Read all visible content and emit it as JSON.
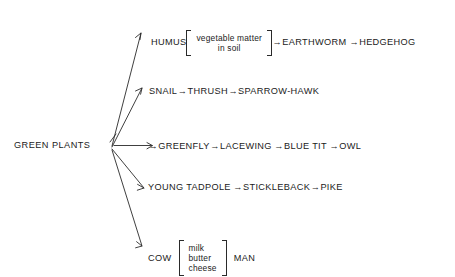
{
  "diagram": {
    "type": "food-web",
    "background_color": "#ffffff",
    "ink_color": "#1b1b1b",
    "source_node": {
      "label": "GREEN PLANTS",
      "x": 14,
      "y": 140
    },
    "arrow_glyph": "→",
    "branches": [
      {
        "id": "humus",
        "row_y": 30,
        "arrow_tip": {
          "x": 141,
          "y": 33
        },
        "items": [
          {
            "kind": "text",
            "label": "HUMUS"
          },
          {
            "kind": "bracket",
            "lines": [
              "vegetable matter",
              "in soil"
            ],
            "align": "center"
          },
          {
            "kind": "arrow",
            "label": "→"
          },
          {
            "kind": "text",
            "label": "EARTHWORM"
          },
          {
            "kind": "arrow",
            "label": "→"
          },
          {
            "kind": "text",
            "label": "HEDGEHOG"
          }
        ]
      },
      {
        "id": "snail",
        "row_y": 86,
        "arrow_tip": {
          "x": 142,
          "y": 88
        },
        "items": [
          {
            "kind": "text",
            "label": "SNAIL"
          },
          {
            "kind": "arrow",
            "label": "→"
          },
          {
            "kind": "text",
            "label": "THRUSH"
          },
          {
            "kind": "arrow",
            "label": "→"
          },
          {
            "kind": "text",
            "label": "SPARROW-HAWK"
          }
        ]
      },
      {
        "id": "greenfly",
        "row_y": 141,
        "arrow_tip": {
          "x": 152,
          "y": 146
        },
        "items": [
          {
            "kind": "arrow",
            "label": "→"
          },
          {
            "kind": "text",
            "label": "GREENFLY"
          },
          {
            "kind": "arrow",
            "label": "→"
          },
          {
            "kind": "text",
            "label": "LACEWING"
          },
          {
            "kind": "arrow",
            "label": "→"
          },
          {
            "kind": "text",
            "label": "BLUE TIT"
          },
          {
            "kind": "arrow",
            "label": "→"
          },
          {
            "kind": "text",
            "label": "OWL"
          }
        ]
      },
      {
        "id": "tadpole",
        "row_y": 182,
        "arrow_tip": {
          "x": 144,
          "y": 188
        },
        "items": [
          {
            "kind": "text",
            "label": "YOUNG TADPOLE"
          },
          {
            "kind": "arrow",
            "label": "→"
          },
          {
            "kind": "text",
            "label": "STICKLEBACK"
          },
          {
            "kind": "arrow",
            "label": "→"
          },
          {
            "kind": "text",
            "label": "PIKE"
          }
        ]
      },
      {
        "id": "cow",
        "row_y": 240,
        "arrow_tip": {
          "x": 142,
          "y": 246
        },
        "items": [
          {
            "kind": "text",
            "label": "COW"
          },
          {
            "kind": "bracket",
            "lines": [
              "milk",
              "butter",
              "cheese"
            ],
            "align": "left"
          },
          {
            "kind": "text",
            "label": "MAN"
          }
        ]
      }
    ]
  }
}
